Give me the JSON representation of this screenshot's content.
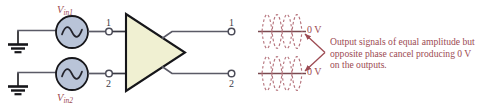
{
  "figure": {
    "background_color": "#ffffff"
  },
  "colors": {
    "wire": "#5a5a66",
    "outline": "#16161a",
    "source_fill": "#b9c4d8",
    "amp_fill": "#f0f0d2",
    "annotation_text": "#9c4a52",
    "terminal_text": "#3b3b44",
    "ground": "#16161a"
  },
  "sources": [
    {
      "id": "vin1",
      "label_main": "V",
      "label_sub": "in1",
      "symbol": "sine-wave"
    },
    {
      "id": "vin2",
      "label_main": "V",
      "label_sub": "in2",
      "symbol": "sine-wave"
    }
  ],
  "amplifier": {
    "shape": "triangle",
    "name": "differential-amplifier"
  },
  "input_terminals": [
    {
      "id": "in-1",
      "label": "1"
    },
    {
      "id": "in-2",
      "label": "2"
    }
  ],
  "output_terminals": [
    {
      "id": "out-1",
      "label": "1"
    },
    {
      "id": "out-2",
      "label": "2"
    }
  ],
  "grounds": [
    {
      "id": "ground-1"
    },
    {
      "id": "ground-2"
    }
  ],
  "waveforms": [
    {
      "id": "output-waveform-1",
      "zero_label": "0 V",
      "description": "two dashed sine waves of opposite phase superimposed on a zero-volt baseline",
      "style": "dashed",
      "phases": [
        0,
        180
      ]
    },
    {
      "id": "output-waveform-2",
      "zero_label": "0 V",
      "description": "two dashed sine waves of opposite phase superimposed on a zero-volt baseline",
      "style": "dashed",
      "phases": [
        0,
        180
      ]
    }
  ],
  "annotation": {
    "lines": [
      "Output signals of equal amplitude but",
      "opposite phase cancel producing 0 V",
      "on the outputs."
    ],
    "line1": "Output signals of equal amplitude but",
    "line2": "opposite phase cancel producing 0 V",
    "line3": "on the outputs."
  }
}
